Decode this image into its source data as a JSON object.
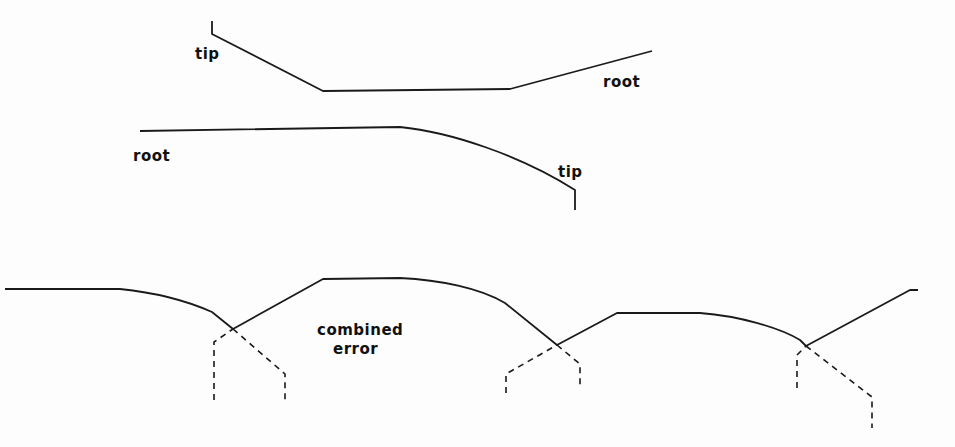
{
  "labels": {
    "top_tip": "tip",
    "top_root": "root",
    "middle_root": "root",
    "middle_tip": "tip",
    "combined_line1": "combined",
    "combined_line2": "error"
  },
  "colors": {
    "stroke": "#1a1a1a",
    "background": "#fdfdfd"
  }
}
